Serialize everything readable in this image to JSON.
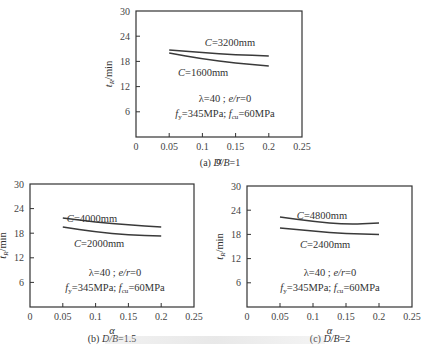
{
  "chart_data": [
    {
      "type": "line",
      "panel": "a",
      "caption": "(a) D/B=1",
      "xlabel": "α",
      "ylabel": "t_R/min",
      "xlim": [
        0,
        0.25
      ],
      "ylim": [
        0,
        30
      ],
      "xticks": [
        "0",
        "0.05",
        "0.1",
        "0.15",
        "0.2",
        "0.25"
      ],
      "yticks": [
        "6",
        "12",
        "18",
        "24",
        "30"
      ],
      "grid": false,
      "annotation_lines": [
        "λ=40 ; e/r=0",
        "fy=345MPa; fcu=60MPa"
      ],
      "x": [
        0.05,
        0.1,
        0.15,
        0.2
      ],
      "series": [
        {
          "name": "C=3200mm",
          "values": [
            20.7,
            20.1,
            19.6,
            19.3
          ]
        },
        {
          "name": "C=1600mm",
          "values": [
            20.0,
            18.6,
            17.6,
            16.9
          ]
        }
      ]
    },
    {
      "type": "line",
      "panel": "b",
      "caption": "(b) D/B=1.5",
      "xlabel": "α",
      "ylabel": "t_R/min",
      "xlim": [
        0,
        0.25
      ],
      "ylim": [
        0,
        30
      ],
      "xticks": [
        "0",
        "0.05",
        "0.1",
        "0.15",
        "0.2",
        "0.25"
      ],
      "yticks": [
        "6",
        "12",
        "18",
        "24",
        "30"
      ],
      "grid": false,
      "annotation_lines": [
        "λ=40 ; e/r=0",
        "fy=345MPa; fcu=60MPa"
      ],
      "x": [
        0.05,
        0.1,
        0.15,
        0.2
      ],
      "series": [
        {
          "name": "C=4000mm",
          "values": [
            21.7,
            20.7,
            20.0,
            19.5
          ]
        },
        {
          "name": "C=2000mm",
          "values": [
            19.5,
            18.3,
            17.6,
            17.3
          ]
        }
      ]
    },
    {
      "type": "line",
      "panel": "c",
      "caption": "(c) D/B=2",
      "xlabel": "α",
      "ylabel": "t_R/min",
      "xlim": [
        0,
        0.25
      ],
      "ylim": [
        0,
        30
      ],
      "xticks": [
        "0",
        "0.05",
        "0.1",
        "0.15",
        "0.2",
        "0.25"
      ],
      "yticks": [
        "6",
        "12",
        "18",
        "24",
        "30"
      ],
      "grid": false,
      "annotation_lines": [
        "λ=40 ; e/r=0",
        "fy=345MPa; fcu=60MPa"
      ],
      "x": [
        0.05,
        0.1,
        0.15,
        0.2
      ],
      "series": [
        {
          "name": "C=4800mm",
          "values": [
            22.3,
            21.2,
            20.5,
            20.8
          ]
        },
        {
          "name": "C=2400mm",
          "values": [
            19.6,
            18.8,
            18.2,
            18.0
          ]
        }
      ]
    }
  ],
  "labels": {
    "a": {
      "upper": "=3200mm",
      "lower": "=1600mm",
      "caption_prefix": "(a) ",
      "caption_var": "D/B",
      "caption_val": "=1"
    },
    "b": {
      "upper": "=4000mm",
      "lower": "=2000mm",
      "caption_prefix": "(b) ",
      "caption_var": "D/B",
      "caption_val": "=1.5"
    },
    "c": {
      "upper": "=4800mm",
      "lower": "=2400mm",
      "caption_prefix": "(c) ",
      "caption_var": "D/B",
      "caption_val": "=2"
    },
    "c_var": "C",
    "xaxis": "α",
    "yaxis_t": "t",
    "yaxis_sub": "R",
    "yaxis_unit": "/min",
    "ann1_lambda": "λ=40 ; ",
    "ann1_er": "e/r",
    "ann1_tail": "=0",
    "ann2_f": "f",
    "ann2_y": "y",
    "ann2_mid": "=345MPa; ",
    "ann2_cu": "cu",
    "ann2_tail": "=60MPa",
    "xticks": [
      "0",
      "0.05",
      "0.1",
      "0.15",
      "0.2",
      "0.25"
    ],
    "yticks": [
      "6",
      "12",
      "18",
      "24",
      "30"
    ]
  },
  "colors": {
    "line": "#3a3a3a",
    "axis": "#333333",
    "text": "#333333"
  }
}
